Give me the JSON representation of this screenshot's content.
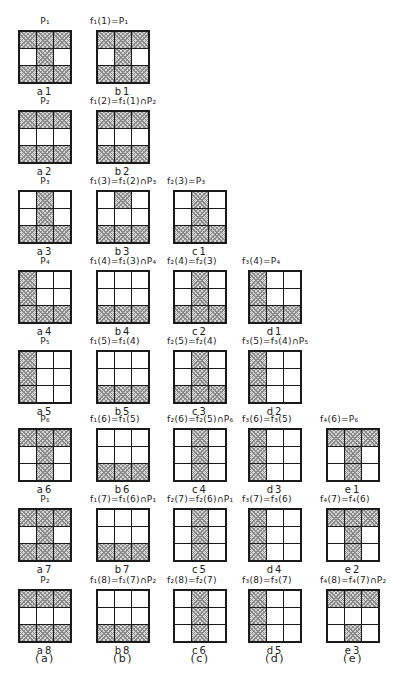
{
  "figure": {
    "footer": [
      {
        "col": "a",
        "label": "(a)"
      },
      {
        "col": "b",
        "label": "(b)"
      },
      {
        "col": "c",
        "label": "(c)"
      },
      {
        "col": "d",
        "label": "(d)"
      },
      {
        "col": "e",
        "label": "(e)"
      }
    ],
    "rows": [
      {
        "cells": [
          {
            "col": "a",
            "title": "P₁",
            "label": "a1",
            "pattern": [
              1,
              1,
              1,
              0,
              1,
              0,
              1,
              1,
              1
            ]
          },
          {
            "col": "b",
            "title": "f₁(1)=P₁",
            "label": "b1",
            "pattern": [
              1,
              1,
              1,
              0,
              1,
              0,
              1,
              1,
              1
            ]
          }
        ]
      },
      {
        "cells": [
          {
            "col": "a",
            "title": "P₂",
            "label": "a2",
            "pattern": [
              1,
              1,
              1,
              0,
              0,
              0,
              1,
              1,
              1
            ]
          },
          {
            "col": "b",
            "title": "f₁(2)=f₁(1)∩P₂",
            "label": "b2",
            "pattern": [
              1,
              1,
              1,
              0,
              0,
              0,
              1,
              1,
              1
            ]
          }
        ]
      },
      {
        "cells": [
          {
            "col": "a",
            "title": "P₃",
            "label": "a3",
            "pattern": [
              0,
              1,
              0,
              0,
              1,
              0,
              1,
              1,
              1
            ]
          },
          {
            "col": "b",
            "title": "f₁(3)=f₁(2)∩P₃",
            "label": "b3",
            "pattern": [
              0,
              1,
              0,
              0,
              0,
              0,
              1,
              1,
              1
            ]
          },
          {
            "col": "c",
            "title": "f₂(3)=P₃",
            "label": "c1",
            "pattern": [
              0,
              1,
              0,
              0,
              1,
              0,
              1,
              1,
              1
            ]
          }
        ]
      },
      {
        "cells": [
          {
            "col": "a",
            "title": "P₄",
            "label": "a4",
            "pattern": [
              1,
              0,
              0,
              1,
              0,
              0,
              1,
              1,
              1
            ]
          },
          {
            "col": "b",
            "title": "f₁(4)=f₁(3)∩P₄",
            "label": "b4",
            "pattern": [
              0,
              0,
              0,
              0,
              0,
              0,
              1,
              1,
              1
            ]
          },
          {
            "col": "c",
            "title": "f₂(4)=f₂(3)",
            "label": "c2",
            "pattern": [
              0,
              1,
              0,
              0,
              1,
              0,
              1,
              1,
              1
            ]
          },
          {
            "col": "d",
            "title": "f₃(4)=P₄",
            "label": "d1",
            "pattern": [
              1,
              0,
              0,
              1,
              0,
              0,
              1,
              1,
              1
            ]
          }
        ]
      },
      {
        "cells": [
          {
            "col": "a",
            "title": "P₅",
            "label": "a5",
            "pattern": [
              1,
              0,
              0,
              1,
              0,
              0,
              1,
              0,
              0
            ]
          },
          {
            "col": "b",
            "title": "f₁(5)=f₁(4)",
            "label": "b5",
            "pattern": [
              0,
              0,
              0,
              0,
              0,
              0,
              1,
              1,
              1
            ]
          },
          {
            "col": "c",
            "title": "f₂(5)=f₂(4)",
            "label": "c3",
            "pattern": [
              0,
              1,
              0,
              0,
              1,
              0,
              1,
              1,
              1
            ]
          },
          {
            "col": "d",
            "title": "f₃(5)=f₃(4)∩P₅",
            "label": "d2",
            "pattern": [
              1,
              0,
              0,
              1,
              0,
              0,
              1,
              0,
              0
            ]
          }
        ]
      },
      {
        "cells": [
          {
            "col": "a",
            "title": "P₆",
            "label": "a6",
            "pattern": [
              1,
              1,
              1,
              0,
              1,
              0,
              0,
              1,
              0
            ]
          },
          {
            "col": "b",
            "title": "f₁(6)=f₁(5)",
            "label": "b6",
            "pattern": [
              0,
              0,
              0,
              0,
              0,
              0,
              1,
              1,
              1
            ]
          },
          {
            "col": "c",
            "title": "f₂(6)=f₂(5)∩P₆",
            "label": "c4",
            "pattern": [
              0,
              1,
              0,
              0,
              1,
              0,
              0,
              1,
              0
            ]
          },
          {
            "col": "d",
            "title": "f₃(6)=f₃(5)",
            "label": "d3",
            "pattern": [
              1,
              0,
              0,
              1,
              0,
              0,
              1,
              0,
              0
            ]
          },
          {
            "col": "e",
            "title": "f₄(6)=P₆",
            "label": "e1",
            "pattern": [
              1,
              1,
              1,
              0,
              1,
              0,
              0,
              1,
              0
            ]
          }
        ]
      },
      {
        "cells": [
          {
            "col": "a",
            "title": "P₁",
            "label": "a7",
            "pattern": [
              1,
              1,
              1,
              0,
              1,
              0,
              1,
              1,
              1
            ]
          },
          {
            "col": "b",
            "title": "f₁(7)=f₁(6)∩P₁",
            "label": "b7",
            "pattern": [
              0,
              0,
              0,
              0,
              0,
              0,
              1,
              1,
              1
            ]
          },
          {
            "col": "c",
            "title": "f₂(7)=f₂(6)∩P₁",
            "label": "c5",
            "pattern": [
              0,
              1,
              0,
              0,
              1,
              0,
              0,
              1,
              0
            ]
          },
          {
            "col": "d",
            "title": "f₃(7)=f₃(6)",
            "label": "d4",
            "pattern": [
              1,
              0,
              0,
              1,
              0,
              0,
              1,
              0,
              0
            ]
          },
          {
            "col": "e",
            "title": "f₄(7)=f₄(6)",
            "label": "e2",
            "pattern": [
              1,
              1,
              1,
              0,
              1,
              0,
              0,
              1,
              0
            ]
          }
        ]
      },
      {
        "cells": [
          {
            "col": "a",
            "title": "P₂",
            "label": "a8",
            "pattern": [
              1,
              1,
              1,
              0,
              0,
              0,
              1,
              1,
              1
            ]
          },
          {
            "col": "b",
            "title": "f₁(8)=f₁(7)∩P₂",
            "label": "b8",
            "pattern": [
              0,
              0,
              0,
              0,
              0,
              0,
              1,
              1,
              1
            ]
          },
          {
            "col": "c",
            "title": "f₂(8)=f₂(7)",
            "label": "c6",
            "pattern": [
              0,
              1,
              0,
              0,
              1,
              0,
              0,
              1,
              0
            ]
          },
          {
            "col": "d",
            "title": "f₃(8)=f₃(7)",
            "label": "d5",
            "pattern": [
              1,
              0,
              0,
              1,
              0,
              0,
              1,
              0,
              0
            ]
          },
          {
            "col": "e",
            "title": "f₄(8)=f₄(7)∩P₂",
            "label": "e3",
            "pattern": [
              1,
              1,
              1,
              0,
              0,
              0,
              0,
              1,
              0
            ]
          }
        ]
      }
    ]
  },
  "colors": {
    "page_background": "#ffffff",
    "ink": "#1c1c1c",
    "hatch_fill": "#d6d6d6",
    "hatch_line": "#8a8a8a"
  }
}
